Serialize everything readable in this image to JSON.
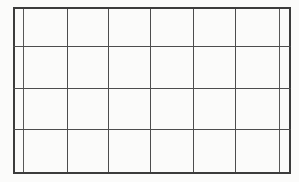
{
  "document": {
    "kind": "grid-table",
    "title": "Blank ruled grid table",
    "background_color": "#fbfbfa",
    "line_color": "#4d4d4d",
    "frame_color": "#3c3c3c",
    "inner_line_color": "#575757"
  },
  "table": {
    "canvas_width": 299,
    "canvas_height": 182,
    "frame": {
      "left": 13,
      "top": 7,
      "right": 290,
      "bottom": 173
    },
    "columns": 8,
    "rows": 4,
    "vertical_lines": [
      13,
      23,
      67,
      108,
      150,
      193,
      235,
      279,
      290
    ],
    "horizontal_lines": [
      7,
      46,
      88,
      129,
      173
    ],
    "cells": [
      [
        "",
        "",
        "",
        "",
        "",
        "",
        "",
        ""
      ],
      [
        "",
        "",
        "",
        "",
        "",
        "",
        "",
        ""
      ],
      [
        "",
        "",
        "",
        "",
        "",
        "",
        "",
        ""
      ],
      [
        "",
        "",
        "",
        "",
        "",
        "",
        "",
        ""
      ]
    ]
  }
}
